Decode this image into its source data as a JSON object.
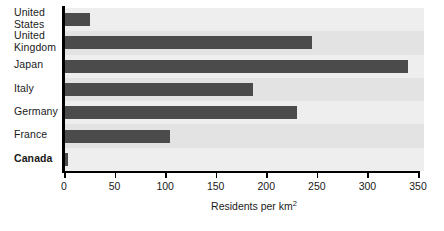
{
  "chart_data": {
    "type": "bar",
    "orientation": "horizontal",
    "title": "",
    "subtitle": "",
    "xlabel": "Residents per km2",
    "xlabel_base": "Residents per km",
    "xlabel_exponent": "2",
    "ylabel": "",
    "categories": [
      "United States",
      "United Kingdom",
      "Japan",
      "Italy",
      "Germany",
      "France",
      "Canada"
    ],
    "category_lines": [
      [
        "United",
        "States"
      ],
      [
        "United",
        "Kingdom"
      ],
      [
        "Japan"
      ],
      [
        "Italy"
      ],
      [
        "Germany"
      ],
      [
        "France"
      ],
      [
        "Canada"
      ]
    ],
    "highlighted_category": "Canada",
    "values": [
      26,
      245,
      340,
      187,
      230,
      105,
      4
    ],
    "xlim": [
      0,
      350
    ],
    "xticks": [
      0,
      50,
      100,
      150,
      200,
      250,
      300,
      350
    ],
    "xtick_labels": [
      "0",
      "50",
      "100",
      "150",
      "200",
      "250",
      "300",
      "350"
    ],
    "grid": false,
    "legend": "none",
    "bar_color": "#4b4b4b",
    "plot_background": "#e3e3e3",
    "band_color": "#eeeeee",
    "axis_color": "#000000",
    "text_color": "#1a1a1a"
  }
}
